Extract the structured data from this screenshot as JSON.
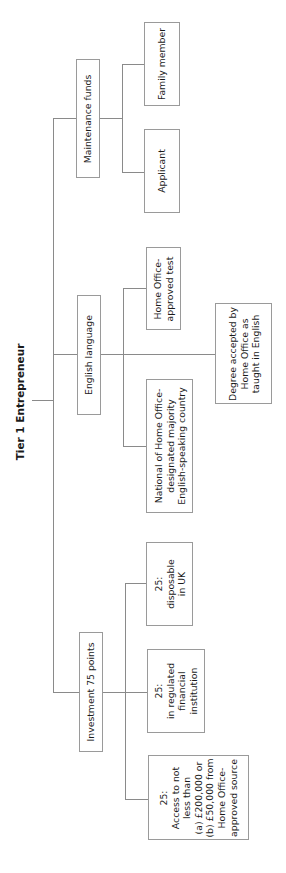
{
  "diagram": {
    "title": "Tier 1 Entrepreneur",
    "orientation": "rotated 90 degrees counter-clockwise",
    "line_color": "#8a8a8a",
    "branches": {
      "maintenance": {
        "label": "Maintenance funds",
        "children": [
          {
            "label": "Family member"
          },
          {
            "label": "Applicant"
          }
        ]
      },
      "english": {
        "label": "English language",
        "children": [
          {
            "label": "Home Office-\napproved test"
          },
          {
            "label": "Degree accepted by\nHome Office as\ntaught in English"
          },
          {
            "label": "National of Home Office-\ndesignated majority\nEnglish-speaking country"
          }
        ]
      },
      "investment": {
        "label": "Investment 75 points",
        "children": [
          {
            "label": "25:\ndisposable\nin UK"
          },
          {
            "label": "25:\nin regulated\nfinancial\ninstitution"
          },
          {
            "label": "25:\nAccess to not\nless than\n(a) £200,000 or\n(b) £50,000 from\nHome Office-\napproved source"
          }
        ]
      }
    }
  }
}
